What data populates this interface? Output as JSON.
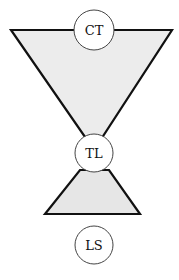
{
  "diagram": {
    "nodes": [
      {
        "id": "ct",
        "label": "CT"
      },
      {
        "id": "tl",
        "label": "TL"
      },
      {
        "id": "ls",
        "label": "LS"
      }
    ],
    "colors": {
      "stroke": "#111111",
      "upper_fill": "#ececec",
      "lower_fill": "#e6e6e6",
      "circle_fill": "#ffffff",
      "circle_stroke": "#444444"
    }
  }
}
